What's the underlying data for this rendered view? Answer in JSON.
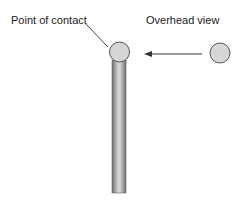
{
  "diagram": {
    "labels": {
      "point_of_contact": "Point of contact",
      "overhead_view": "Overhead view"
    },
    "elements": {
      "pole": {
        "description": "vertical pole with ball on top (side view)"
      },
      "contact_ball": {
        "description": "ball at top of pole"
      },
      "overhead_ball": {
        "description": "ball seen from overhead"
      },
      "arrow": {
        "direction": "left",
        "description": "arrow from overhead ball toward contact point"
      }
    },
    "colors": {
      "ball_fill": "#d6d6d6",
      "ball_stroke": "#555555",
      "pole_dark": "#6e6e6e",
      "pole_light": "#d8d8d8",
      "line": "#333333"
    }
  }
}
